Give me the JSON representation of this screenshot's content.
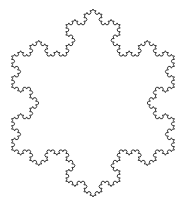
{
  "figure": {
    "type": "koch-snowflake",
    "width": 187,
    "height": 209,
    "background": "#ffffff",
    "stroke_color": "#333333",
    "stroke_width": 1,
    "center": [
      93,
      103
    ],
    "radius": 94,
    "iterations": 4,
    "orientation": "point-up"
  }
}
